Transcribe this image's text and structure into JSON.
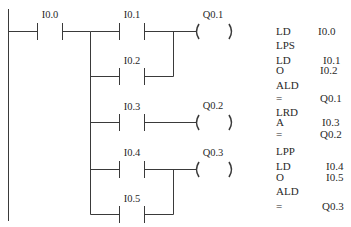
{
  "ladder": {
    "contacts": [
      {
        "id": "c00",
        "label": "I0.0",
        "x1": 37,
        "x2": 62,
        "y": 31
      },
      {
        "id": "c01",
        "label": "I0.1",
        "x1": 119,
        "x2": 144,
        "y": 31
      },
      {
        "id": "c02",
        "label": "I0.2",
        "x1": 119,
        "x2": 144,
        "y": 76
      },
      {
        "id": "c03",
        "label": "I0.3",
        "x1": 119,
        "x2": 144,
        "y": 122
      },
      {
        "id": "c04",
        "label": "I0.4",
        "x1": 119,
        "x2": 144,
        "y": 169
      },
      {
        "id": "c05",
        "label": "I0.5",
        "x1": 119,
        "x2": 144,
        "y": 214
      }
    ],
    "coils": [
      {
        "id": "q01",
        "label": "Q0.1",
        "x1": 197,
        "x2": 231,
        "y": 31
      },
      {
        "id": "q02",
        "label": "Q0.2",
        "x1": 197,
        "x2": 231,
        "y": 122
      },
      {
        "id": "q03",
        "label": "Q0.3",
        "x1": 197,
        "x2": 231,
        "y": 169
      }
    ],
    "line_color": "#3a3a3a"
  },
  "instruction_list": [
    {
      "op": "LD",
      "arg": "I0.0",
      "y": 26,
      "argx": 318
    },
    {
      "op": "LPS",
      "arg": "",
      "y": 40,
      "argx": 318
    },
    {
      "op": "LD",
      "arg": "I0.1",
      "y": 55,
      "argx": 323
    },
    {
      "op": "O",
      "arg": "I0.2",
      "y": 65,
      "argx": 320
    },
    {
      "op": "ALD",
      "arg": "",
      "y": 80,
      "argx": 318
    },
    {
      "op": "=",
      "arg": "Q0.1",
      "y": 93,
      "argx": 320
    },
    {
      "op": "LRD",
      "arg": "",
      "y": 107,
      "argx": 318
    },
    {
      "op": "A",
      "arg": "I0.3",
      "y": 117,
      "argx": 322
    },
    {
      "op": "=",
      "arg": "Q0.2",
      "y": 129,
      "argx": 320
    },
    {
      "op": "LPP",
      "arg": "",
      "y": 146,
      "argx": 318
    },
    {
      "op": "LD",
      "arg": "I0.4",
      "y": 161,
      "argx": 326
    },
    {
      "op": "O",
      "arg": "I0.5",
      "y": 172,
      "argx": 326
    },
    {
      "op": "ALD",
      "arg": "",
      "y": 186,
      "argx": 318
    },
    {
      "op": "=",
      "arg": "Q0.3",
      "y": 201,
      "argx": 322
    }
  ]
}
